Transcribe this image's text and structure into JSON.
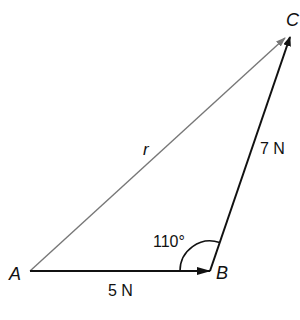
{
  "diagram": {
    "type": "vector-triangle",
    "points": {
      "A": {
        "label": "A",
        "x": 30,
        "y": 271
      },
      "B": {
        "label": "B",
        "x": 210,
        "y": 271
      },
      "C": {
        "label": "C",
        "x": 289,
        "y": 37
      }
    },
    "vectors": [
      {
        "id": "AB",
        "from": "A",
        "to": "B",
        "label": "5 N",
        "color": "#111111"
      },
      {
        "id": "BC",
        "from": "B",
        "to": "C",
        "label": "7 N",
        "color": "#111111"
      },
      {
        "id": "AC",
        "from": "A",
        "to": "C",
        "label": "r",
        "color": "#777777"
      }
    ],
    "angle": {
      "at": "B",
      "label": "110°"
    }
  }
}
